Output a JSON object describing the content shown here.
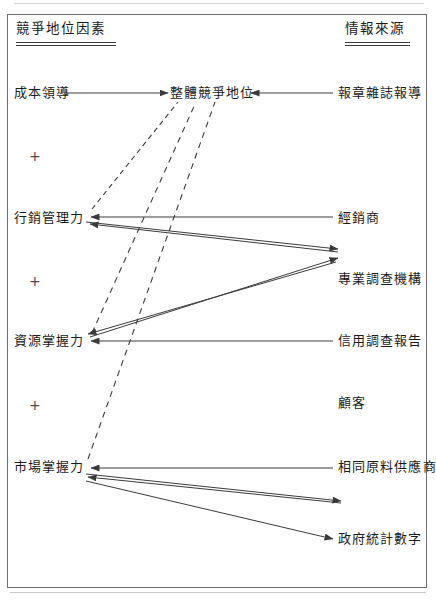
{
  "diagram": {
    "title_left": "競爭地位因素",
    "title_right": "情報來源",
    "plus_symbol": "+",
    "colors": {
      "ink": "#1b1b1b",
      "line": "#4a4a4a",
      "frame": "#6d6d6d",
      "background": "#ffffff"
    },
    "left_column": {
      "header": "競爭地位因素",
      "factors": [
        {
          "id": "cost-leadership",
          "label": "成本領導",
          "x": 14,
          "y": 93
        },
        {
          "id": "marketing-capability",
          "label": "行銷管理力",
          "x": 14,
          "y": 218
        },
        {
          "id": "resource-control",
          "label": "資源掌握力",
          "x": 14,
          "y": 340
        },
        {
          "id": "market-control",
          "label": "市場掌握力",
          "x": 14,
          "y": 466
        }
      ],
      "connectors": [
        {
          "id": "plus-1",
          "symbol": "+",
          "x": 30,
          "y": 150
        },
        {
          "id": "plus-2",
          "symbol": "+",
          "x": 30,
          "y": 275
        },
        {
          "id": "plus-3",
          "symbol": "+",
          "x": 30,
          "y": 399
        }
      ]
    },
    "center": {
      "overall_position": {
        "id": "overall-competitive-position",
        "label": "整體競爭地位",
        "x": 170,
        "y": 93
      }
    },
    "right_column": {
      "header": "情報來源",
      "sources": [
        {
          "id": "newspapers-magazines",
          "label": "報章雜誌報導",
          "x": 338,
          "y": 93
        },
        {
          "id": "distributors",
          "label": "經銷商",
          "x": 338,
          "y": 218
        },
        {
          "id": "research-agency",
          "label": "專業調查機構",
          "x": 338,
          "y": 279
        },
        {
          "id": "credit-report",
          "label": "信用調查報告",
          "x": 338,
          "y": 340
        },
        {
          "id": "customers",
          "label": "顧客",
          "x": 338,
          "y": 402
        },
        {
          "id": "same-material-supplier",
          "label": "相同原料供應商",
          "x": 338,
          "y": 466
        },
        {
          "id": "government-statistics",
          "label": "政府統計數字",
          "x": 338,
          "y": 539
        }
      ]
    },
    "edges": [
      {
        "id": "edge-cost-to-overall",
        "from": "成本領導",
        "to": "整體競爭地位",
        "style": "solid",
        "direction": "right"
      },
      {
        "id": "edge-news-to-overall",
        "from": "報章雜誌報導",
        "to": "整體競爭地位",
        "style": "solid",
        "direction": "left"
      },
      {
        "id": "edge-marketing-to-overall",
        "from": "行銷管理力",
        "to": "整體競爭地位",
        "style": "dashed",
        "direction": "right"
      },
      {
        "id": "edge-resource-to-overall",
        "from": "資源掌握力",
        "to": "整體競爭地位",
        "style": "dashed",
        "direction": "right"
      },
      {
        "id": "edge-market-to-overall",
        "from": "市場掌握力",
        "to": "整體競爭地位",
        "style": "dashed",
        "direction": "right"
      },
      {
        "id": "edge-distributor-to-marketing",
        "from": "經銷商",
        "to": "行銷管理力",
        "style": "solid",
        "direction": "left"
      },
      {
        "id": "edge-marketing-to-agency",
        "from": "行銷管理力",
        "to": "專業調查機構",
        "style": "solid",
        "direction": "right"
      },
      {
        "id": "edge-resource-to-agency",
        "from": "資源掌握力",
        "to": "專業調查機構",
        "style": "solid",
        "direction": "right"
      },
      {
        "id": "edge-agency-to-resource",
        "from": "專業調查機構",
        "to": "資源掌握力",
        "style": "solid",
        "direction": "left"
      },
      {
        "id": "edge-credit-to-resource",
        "from": "信用調查報告",
        "to": "資源掌握力",
        "style": "solid",
        "direction": "left"
      },
      {
        "id": "edge-supplier-to-market",
        "from": "相同原料供應商",
        "to": "市場掌握力",
        "style": "solid",
        "direction": "left"
      },
      {
        "id": "edge-market-to-customer",
        "from": "市場掌握力",
        "to": "顧客",
        "style": "solid",
        "direction": "right"
      },
      {
        "id": "edge-market-to-govstats",
        "from": "市場掌握力",
        "to": "政府統計數字",
        "style": "solid",
        "direction": "right"
      }
    ]
  }
}
